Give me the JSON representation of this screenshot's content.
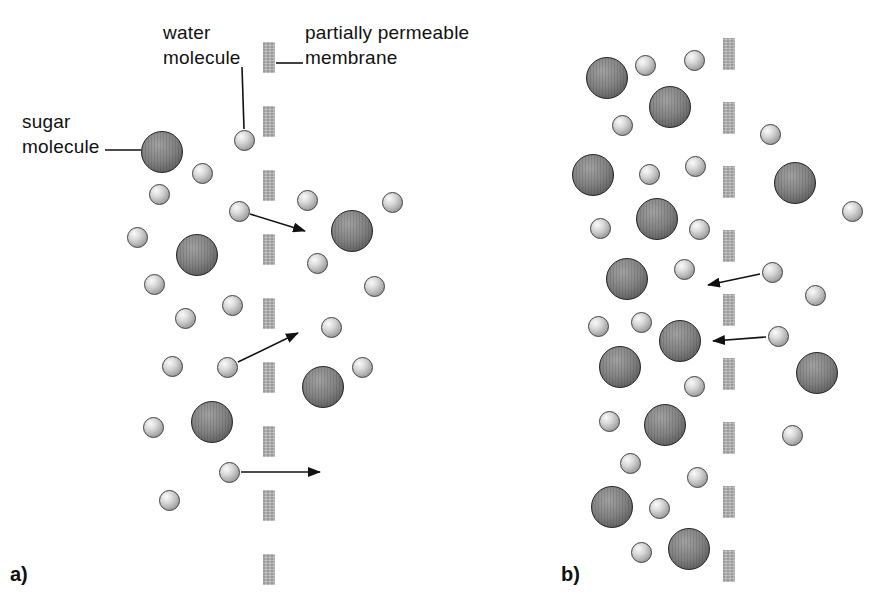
{
  "figure": {
    "labels": {
      "water": {
        "lines": [
          "water",
          "molecule"
        ]
      },
      "membrane": {
        "lines": [
          "partially permeable",
          "membrane"
        ]
      },
      "sugar": {
        "lines": [
          "sugar",
          "molecule"
        ]
      }
    },
    "captions": {
      "a": "a)",
      "b": "b)"
    }
  },
  "molecule_sizes": {
    "water_diameter": 21,
    "sugar_diameter": 42
  },
  "colors": {
    "membrane": "#a4a4a4",
    "arrow": "#111111",
    "text": "#111111",
    "water_body": "#c9c9c9",
    "sugar_body": "#7d7d7d",
    "background": "#ffffff"
  },
  "leader_lines": [
    [
      105,
      150,
      141,
      150
    ],
    [
      242,
      67,
      244,
      129
    ],
    [
      276,
      63,
      303,
      63
    ]
  ],
  "panels": [
    {
      "id": "a",
      "membrane": {
        "x": 263,
        "width": 12,
        "dash_top": 42,
        "dash_height": 31,
        "dash_step": 64,
        "dash_count": 9
      },
      "waters": [
        [
          244,
          140
        ],
        [
          202,
          173
        ],
        [
          159,
          194
        ],
        [
          239,
          211
        ],
        [
          137,
          237
        ],
        [
          154,
          284
        ],
        [
          232,
          305
        ],
        [
          185,
          318
        ],
        [
          172,
          366
        ],
        [
          227,
          367
        ],
        [
          153,
          427
        ],
        [
          229,
          472
        ],
        [
          169,
          500
        ],
        [
          307,
          200
        ],
        [
          392,
          202
        ],
        [
          317,
          263
        ],
        [
          374,
          286
        ],
        [
          331,
          327
        ],
        [
          362,
          367
        ]
      ],
      "sugars": [
        [
          162,
          152
        ],
        [
          197,
          255
        ],
        [
          212,
          422
        ],
        [
          352,
          231
        ],
        [
          323,
          387
        ]
      ],
      "arrows": [
        [
          250,
          214,
          305,
          231
        ],
        [
          238,
          362,
          298,
          333
        ],
        [
          241,
          472,
          320,
          472
        ]
      ]
    },
    {
      "id": "b",
      "membrane": {
        "x": 723,
        "width": 12,
        "dash_top": 38,
        "dash_height": 32,
        "dash_step": 64,
        "dash_count": 9
      },
      "waters": [
        [
          645,
          65
        ],
        [
          694,
          60
        ],
        [
          622,
          125
        ],
        [
          649,
          174
        ],
        [
          695,
          166
        ],
        [
          600,
          228
        ],
        [
          699,
          229
        ],
        [
          684,
          269
        ],
        [
          641,
          322
        ],
        [
          598,
          326
        ],
        [
          694,
          386
        ],
        [
          609,
          421
        ],
        [
          630,
          463
        ],
        [
          697,
          477
        ],
        [
          659,
          508
        ],
        [
          641,
          552
        ],
        [
          770,
          134
        ],
        [
          852,
          211
        ],
        [
          772,
          272
        ],
        [
          815,
          295
        ],
        [
          778,
          336
        ],
        [
          792,
          435
        ]
      ],
      "sugars": [
        [
          607,
          78
        ],
        [
          670,
          107
        ],
        [
          593,
          175
        ],
        [
          657,
          219
        ],
        [
          627,
          279
        ],
        [
          680,
          341
        ],
        [
          620,
          367
        ],
        [
          665,
          425
        ],
        [
          612,
          507
        ],
        [
          689,
          549
        ],
        [
          795,
          183
        ],
        [
          817,
          373
        ]
      ],
      "arrows": [
        [
          760,
          274,
          708,
          285
        ],
        [
          766,
          337,
          713,
          341
        ]
      ]
    }
  ]
}
